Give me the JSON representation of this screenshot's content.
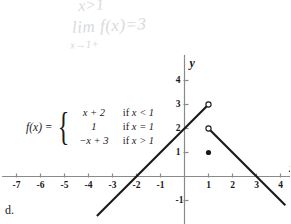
{
  "annotations": {
    "top_note": "x>1",
    "limit_note": "lim f(x)=3",
    "limit_sub": "x→1+"
  },
  "formula": {
    "lhs": "f(x) =",
    "rows": [
      {
        "expr": "x + 2",
        "keyword": "if",
        "cond": "x < 1"
      },
      {
        "expr": "1",
        "keyword": "if",
        "cond": "x = 1"
      },
      {
        "expr": "−x + 3",
        "keyword": "if",
        "cond": "x > 1"
      }
    ]
  },
  "choice": {
    "letter": "d."
  },
  "chart_data": {
    "type": "line",
    "title": "",
    "xlabel": "x",
    "ylabel": "y",
    "xlim": [
      -7.6,
      4.6
    ],
    "ylim": [
      -2.0,
      4.9
    ],
    "grid": false,
    "legend": "none",
    "x_ticks": [
      -7,
      -6,
      -5,
      -4,
      -3,
      -2,
      -1,
      1,
      2,
      3,
      4
    ],
    "x_tick_labels": [
      "-7",
      "-6",
      "-5",
      "-4",
      "-3",
      "-2",
      "-1",
      "1",
      "2",
      "3",
      "4"
    ],
    "y_ticks": [
      -1,
      1,
      2,
      3,
      4
    ],
    "y_tick_labels": [
      "-1",
      "1",
      "2",
      "3",
      "4"
    ],
    "series": [
      {
        "name": "x+2 for x<1",
        "type": "segment",
        "points": [
          [
            -3.65,
            -1.65
          ],
          [
            1,
            3
          ]
        ],
        "endpoint_markers": [
          "none",
          "open"
        ]
      },
      {
        "name": "-x+3 for x>1",
        "type": "segment",
        "points": [
          [
            1,
            2
          ],
          [
            4.2,
            -1.2
          ]
        ],
        "endpoint_markers": [
          "open",
          "none"
        ]
      },
      {
        "name": "f(1)=1",
        "type": "point",
        "points": [
          [
            1,
            1
          ]
        ],
        "endpoint_markers": [
          "filled"
        ]
      }
    ],
    "open_circles": [
      [
        1,
        3
      ],
      [
        1,
        2
      ]
    ],
    "filled_points": [
      [
        1,
        1
      ]
    ]
  },
  "colors": {
    "axis": "#8a8a8a",
    "curve": "#1a1a1a",
    "text": "#1a1a1a",
    "handwriting": "#c9cdd2",
    "background": "#ffffff"
  }
}
